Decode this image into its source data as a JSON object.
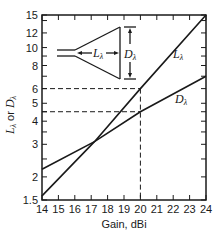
{
  "chart_data": {
    "type": "line",
    "title": "",
    "xlabel": "Gain, dBi",
    "ylabel": "Lλ or Dλ",
    "xlim": [
      14,
      24
    ],
    "ylim": [
      1.5,
      15
    ],
    "yscale": "log",
    "grid": false,
    "x_ticks": [
      14,
      15,
      16,
      17,
      18,
      19,
      20,
      21,
      22,
      23,
      24
    ],
    "y_ticks": [
      1.5,
      2,
      3,
      4,
      5,
      6,
      8,
      10,
      12,
      15
    ],
    "series": [
      {
        "name": "Lλ",
        "x": [
          14,
          17.2,
          20,
          24
        ],
        "values": [
          1.58,
          3.1,
          6.0,
          15.0
        ]
      },
      {
        "name": "Dλ",
        "x": [
          14,
          17.2,
          20,
          24
        ],
        "values": [
          2.2,
          3.1,
          4.5,
          7.0
        ]
      }
    ],
    "annotations": [
      {
        "type": "dashed-reference",
        "x": 20,
        "y_L": 6,
        "y_D": 4.5
      },
      {
        "type": "inset-diagram",
        "description": "Horn antenna with length Lλ and aperture Dλ",
        "labels": [
          "Lλ",
          "Dλ"
        ]
      }
    ],
    "legend": {
      "position": "inline-labels",
      "entries": [
        "Lλ",
        "Dλ"
      ]
    }
  },
  "labels": {
    "xlabel": "Gain, dBi",
    "ylabel_L": "L",
    "ylabel_or": " or ",
    "ylabel_D": "D",
    "sub": "λ",
    "series_L": "L",
    "series_D": "D",
    "inset_L": "L",
    "inset_D": "D"
  },
  "x_tick_labels": [
    "14",
    "15",
    "16",
    "17",
    "18",
    "19",
    "20",
    "21",
    "22",
    "23",
    "24"
  ],
  "y_tick_labels": [
    "1.5",
    "2",
    "3",
    "4",
    "5",
    "6",
    "8",
    "10",
    "12",
    "15"
  ]
}
